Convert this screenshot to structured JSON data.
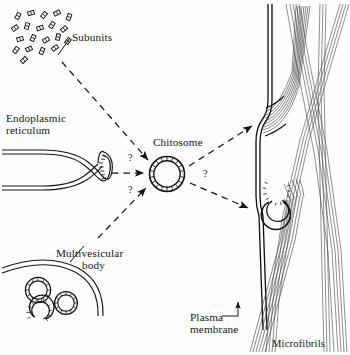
{
  "figure": {
    "type": "diagram",
    "style": "black and white line drawing, serif labels"
  },
  "labels": {
    "subunits": "Subunits",
    "endoplasmic_reticulum_line1": "Endoplasmic",
    "endoplasmic_reticulum_line2": "reticulum",
    "chitosome": "Chitosome",
    "multivesicular_body_line1": "Multivesicular",
    "multivesicular_body_line2": "body",
    "plasma_membrane_line1": "Plasma",
    "plasma_membrane_line2": "membrane",
    "microfibrils": "Microfibrils"
  },
  "annotations": {
    "question_mark_upper_left": "?",
    "question_mark_lower_left": "?",
    "question_mark_right": "?"
  },
  "structures": [
    {
      "name": "subunits-cluster",
      "description": "scattered small rectangles representing chitin synthase subunits",
      "count": 20
    },
    {
      "name": "endoplasmic-reticulum",
      "description": "double-membrane tube widening into a ribosome-studded bulb"
    },
    {
      "name": "chitosome",
      "description": "circular vesicle with hatched double-membrane wall"
    },
    {
      "name": "multivesicular-body",
      "description": "curved membrane enclosing three small vesicles, one open C-shaped"
    },
    {
      "name": "plasma-membrane",
      "description": "vertical double line with bulge where microfibrils emerge"
    },
    {
      "name": "open-vesicle-at-membrane",
      "description": "C-shaped vesicle discharging a microfibril bundle"
    },
    {
      "name": "microfibril-bundles",
      "description": "crossing bundles of fine parallel fibres"
    }
  ],
  "arrows": [
    {
      "from": "subunits",
      "to": "chitosome",
      "style": "dashed"
    },
    {
      "from": "endoplasmic-reticulum",
      "to": "chitosome",
      "style": "dashed",
      "marked": "?"
    },
    {
      "from": "multivesicular-body",
      "to": "chitosome",
      "style": "dashed",
      "marked": "?"
    },
    {
      "from": "chitosome",
      "to": "plasma-membrane-upper-site",
      "style": "dashed"
    },
    {
      "from": "chitosome",
      "to": "open-vesicle-at-membrane",
      "style": "dashed",
      "marked": "?"
    },
    {
      "from": "plasma-membrane-label",
      "to": "plasma-membrane",
      "style": "solid-elbow"
    }
  ],
  "colors": {
    "ink": "#141414",
    "fibril": "#4a4a4a",
    "background": "#ffffff"
  }
}
